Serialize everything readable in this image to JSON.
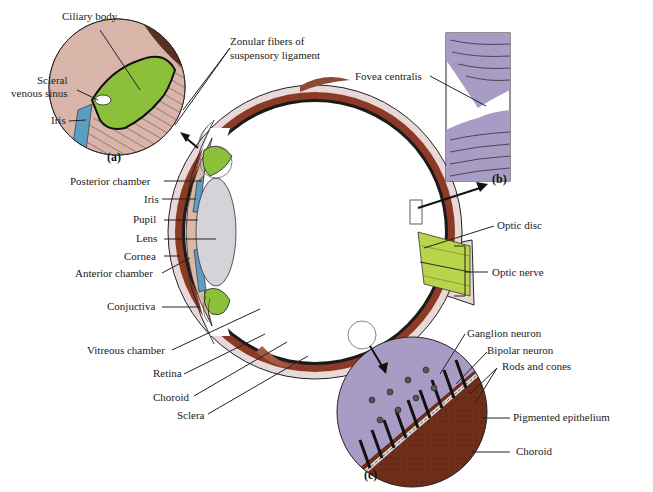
{
  "diagram": {
    "colors": {
      "sclera": "#e8d8d8",
      "choroid": "#8b3a26",
      "retina": "#1a1a1a",
      "cornea_tissue": "#dcb8a8",
      "lens": "#d4d4d8",
      "iris": "#5a9ec4",
      "ciliary": "#8cbf3a",
      "optic_nerve": "#b9d44a",
      "retina_inset": "#a89bc4",
      "choroid_inset": "#6e2e1a"
    },
    "panels": {
      "a": "(a)",
      "b": "(b)",
      "c": "(c)"
    },
    "inset_a_labels": {
      "ciliary_body": "Ciliary body",
      "zonular_line1": "Zonular fibers of",
      "zonular_line2": "suspensory ligament",
      "scleral_line1": "Scleral",
      "scleral_line2": "venous sinus",
      "iris": "Iris"
    },
    "main_left_labels": {
      "posterior_chamber": "Posterior chamber",
      "iris": "Iris",
      "pupil": "Pupil",
      "lens": "Lens",
      "cornea": "Cornea",
      "anterior_chamber": "Anterior chamber",
      "conjuctiva": "Conjuctiva",
      "vitreous_chamber": "Vitreous chamber",
      "retina": "Retina",
      "choroid": "Choroid",
      "sclera": "Sclera"
    },
    "inset_b_labels": {
      "fovea": "Fovea centralis"
    },
    "main_right_labels": {
      "optic_disc": "Optic disc",
      "optic_nerve": "Optic nerve"
    },
    "inset_c_labels": {
      "ganglion": "Ganglion neuron",
      "bipolar": "Bipolar neuron",
      "rods_cones": "Rods and cones",
      "pigmented": "Pigmented epithelium",
      "choroid": "Choroid"
    }
  }
}
